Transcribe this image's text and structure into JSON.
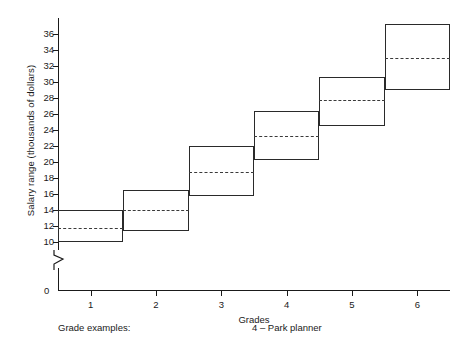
{
  "chart_data": {
    "type": "bar",
    "title": "",
    "xlabel": "Grades",
    "ylabel": "Salary range (thousands of dollars)",
    "categories": [
      "1",
      "2",
      "3",
      "4",
      "5",
      "6"
    ],
    "xlim": [
      0.5,
      6.5
    ],
    "ylim": [
      9,
      38
    ],
    "yticks": [
      10,
      12,
      14,
      16,
      18,
      20,
      22,
      24,
      26,
      28,
      30,
      32,
      34,
      36
    ],
    "ytick_labels": [
      "10",
      "12",
      "14",
      "16",
      "18",
      "20",
      "22",
      "24",
      "26",
      "28",
      "30",
      "32",
      "34",
      "36"
    ],
    "xticks": [
      1,
      2,
      3,
      4,
      5,
      6
    ],
    "xtick_labels": [
      "1",
      "2",
      "3",
      "4",
      "5",
      "6"
    ],
    "origin_label": "0",
    "axis_break": true,
    "grid": false,
    "legend": false,
    "series": [
      {
        "name": "Salary range",
        "boxes": [
          {
            "grade": 1,
            "low": 10.0,
            "high": 14.0,
            "midpoint": 11.8
          },
          {
            "grade": 2,
            "low": 11.4,
            "high": 16.5,
            "midpoint": 14.0
          },
          {
            "grade": 3,
            "low": 15.8,
            "high": 22.0,
            "midpoint": 18.8
          },
          {
            "grade": 4,
            "low": 20.2,
            "high": 26.4,
            "midpoint": 23.3
          },
          {
            "grade": 5,
            "low": 24.5,
            "high": 30.6,
            "midpoint": 27.7
          },
          {
            "grade": 6,
            "low": 29.0,
            "high": 37.2,
            "midpoint": 33.0
          }
        ]
      }
    ]
  },
  "footer": {
    "label": "Grade examples:",
    "example": "4 – Park planner"
  }
}
